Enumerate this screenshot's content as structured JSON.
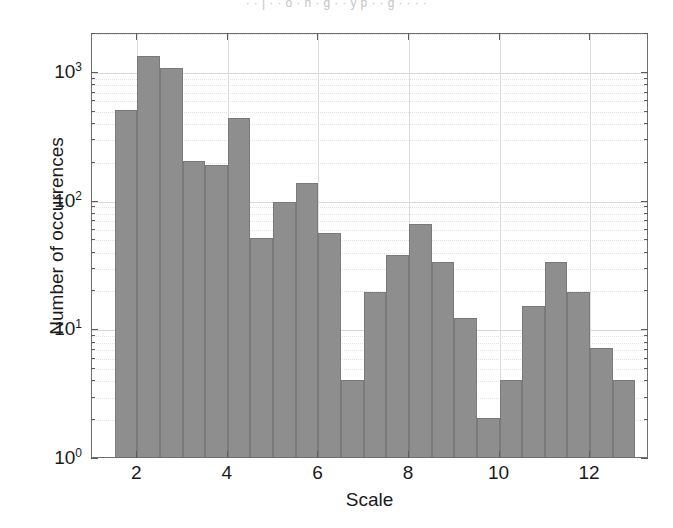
{
  "scan_artifact": {
    "top_bleed_text": "· · | · · o · n · g · · y p · · g · · · ·"
  },
  "chart_data": {
    "type": "bar",
    "title": "",
    "subtitle": "",
    "xlabel": "Scale",
    "ylabel": "Number of occurrences",
    "yscale": "log",
    "ylim": [
      1,
      2000
    ],
    "xlim": [
      1.0,
      13.3
    ],
    "grid": true,
    "legend": null,
    "bin_width": 0.5,
    "ytick_labels": [
      "10",
      "10",
      "10",
      "10"
    ],
    "ytick_exponents": [
      "0",
      "1",
      "2",
      "3"
    ],
    "ytick_values": [
      1,
      10,
      100,
      1000
    ],
    "xtick_labels": [
      "2",
      "4",
      "6",
      "8",
      "10",
      "12"
    ],
    "xtick_values": [
      2,
      4,
      6,
      8,
      10,
      12
    ],
    "bar_color": "#8e8e8e",
    "bar_edge_color": "#7a7a7a",
    "axis_color": "#6e6e6e",
    "grid_color": "#d7d7dc",
    "categories": [
      1.5,
      2.0,
      2.5,
      3.0,
      3.5,
      4.0,
      4.5,
      5.0,
      5.5,
      6.0,
      6.5,
      7.0,
      7.5,
      8.0,
      8.5,
      9.0,
      9.5,
      10.0,
      10.5,
      11.0,
      11.5,
      12.0,
      12.5
    ],
    "values": [
      500,
      1300,
      1050,
      200,
      185,
      430,
      50,
      95,
      135,
      55,
      4,
      19,
      37,
      65,
      33,
      12,
      2,
      4,
      15,
      33,
      19,
      7,
      4
    ]
  }
}
